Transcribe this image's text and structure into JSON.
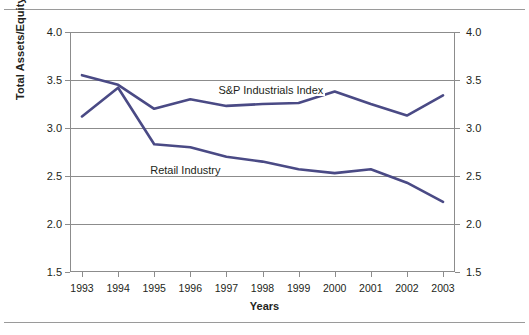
{
  "chart_data": {
    "type": "line",
    "title": "",
    "xlabel": "Years",
    "ylabel": "Total Assets/Equity",
    "categories": [
      "1993",
      "1994",
      "1995",
      "1996",
      "1997",
      "1998",
      "1999",
      "2000",
      "2001",
      "2002",
      "2003"
    ],
    "ylim": [
      1.5,
      4.0
    ],
    "ytick_step": 0.5,
    "yticks": [
      "1.5",
      "2.0",
      "2.5",
      "3.0",
      "3.5",
      "4.0"
    ],
    "ytick_values": [
      1.5,
      2.0,
      2.5,
      3.0,
      3.5,
      4.0
    ],
    "grid": true,
    "grid_axis": "y",
    "legend_position": "inline-annotation",
    "dual_y_axis": true,
    "right_axis_mirrors_left": true,
    "series": [
      {
        "name": "S&P Industrials Index",
        "color": "#4a4a85",
        "values": [
          3.55,
          3.45,
          3.2,
          3.3,
          3.23,
          3.25,
          3.26,
          3.38,
          3.25,
          3.13,
          3.34
        ]
      },
      {
        "name": "Retail Industry",
        "color": "#4a4a85",
        "values": [
          3.12,
          3.42,
          2.83,
          2.8,
          2.7,
          2.65,
          2.57,
          2.53,
          2.57,
          2.43,
          2.23
        ]
      }
    ],
    "annotations": [
      {
        "text": "S&P Industrials Index",
        "series": "S&P Industrials Index"
      },
      {
        "text": "Retail Industry",
        "series": "Retail Industry"
      }
    ]
  },
  "style": {
    "line_color": "#4a4a85",
    "axis_color": "#8c8c8c",
    "text_color": "#231f20",
    "background": "#ffffff"
  }
}
